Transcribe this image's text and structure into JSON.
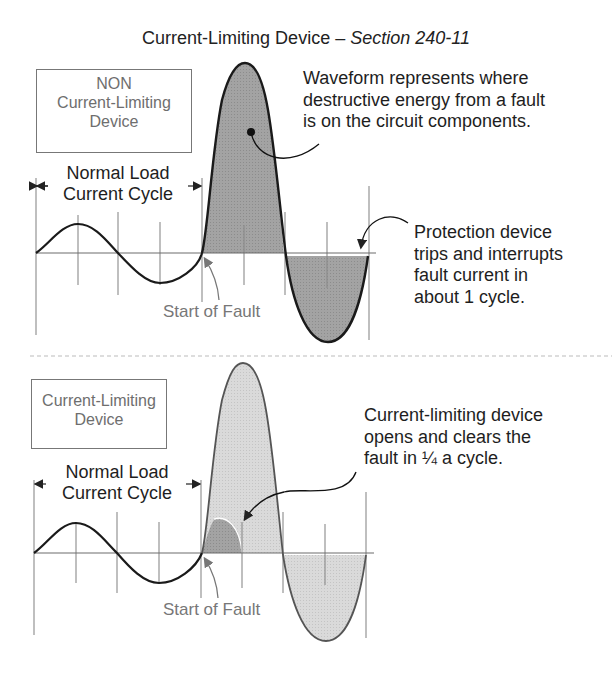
{
  "title": {
    "main": "Current-Limiting Device – ",
    "italic": "Section 240-11"
  },
  "top_panel": {
    "device_box": {
      "line1": "NON",
      "line2": "Current-Limiting",
      "line3": "Device"
    },
    "normal_load": {
      "line1": "Normal Load",
      "line2": "Current Cycle"
    },
    "waveform_note": {
      "line1": "Waveform represents where",
      "line2": "destructive energy from a fault",
      "line3": "is on the circuit components."
    },
    "trip_note": {
      "line1": "Protection device",
      "line2": "trips and interrupts",
      "line3": "fault current in",
      "line4": "about 1 cycle."
    },
    "start_of_fault": "Start of Fault"
  },
  "bottom_panel": {
    "device_box": {
      "line1": "Current-Limiting",
      "line2": "Device"
    },
    "normal_load": {
      "line1": "Normal Load",
      "line2": "Current Cycle"
    },
    "clear_note": {
      "line1": "Current-limiting device",
      "line2": "opens and clears the",
      "line3": "fault in ¼ a cycle."
    },
    "start_of_fault": "Start of Fault"
  },
  "colors": {
    "fault_fill_dark": "#9a9a9a",
    "fault_fill_light": "#d6d6d6",
    "limited_energy_fill": "#8e8e8e",
    "waveform_stroke": "#1a1a1a",
    "grid_line": "#8a8a8a",
    "label_gray": "#777777",
    "divider": "#bbbbbb"
  }
}
